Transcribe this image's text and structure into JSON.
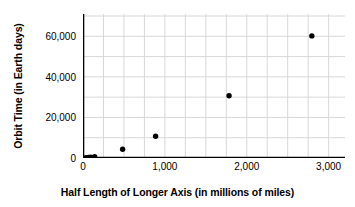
{
  "chart_data": {
    "type": "scatter",
    "title": "",
    "xlabel": "Half Length of Longer Axis (in millions of miles)",
    "ylabel": "Orbit Time (in Earth days)",
    "xlim": [
      0,
      3200
    ],
    "ylim": [
      0,
      71000
    ],
    "grid": true,
    "legend_position": "none",
    "x_major_ticks": [
      0,
      1000,
      2000,
      3000
    ],
    "x_major_tick_labels": [
      "0",
      "1,000",
      "2,000",
      "3,000"
    ],
    "x_minor_tick_interval": 250,
    "y_major_ticks": [
      0,
      20000,
      40000,
      60000
    ],
    "y_major_tick_labels": [
      "0",
      "20,000",
      "40,000",
      "60,000"
    ],
    "y_minor_tick_interval": 10000,
    "marker": "filled-circle",
    "marker_color": "#000000",
    "grid_color": "#d8d8d8",
    "axis_color": "#000000",
    "points": [
      {
        "x": 36,
        "y": 88
      },
      {
        "x": 67,
        "y": 225
      },
      {
        "x": 93,
        "y": 365
      },
      {
        "x": 142,
        "y": 687
      },
      {
        "x": 484,
        "y": 4333
      },
      {
        "x": 887,
        "y": 10759
      },
      {
        "x": 1784,
        "y": 30687
      },
      {
        "x": 2795,
        "y": 60190
      }
    ]
  }
}
